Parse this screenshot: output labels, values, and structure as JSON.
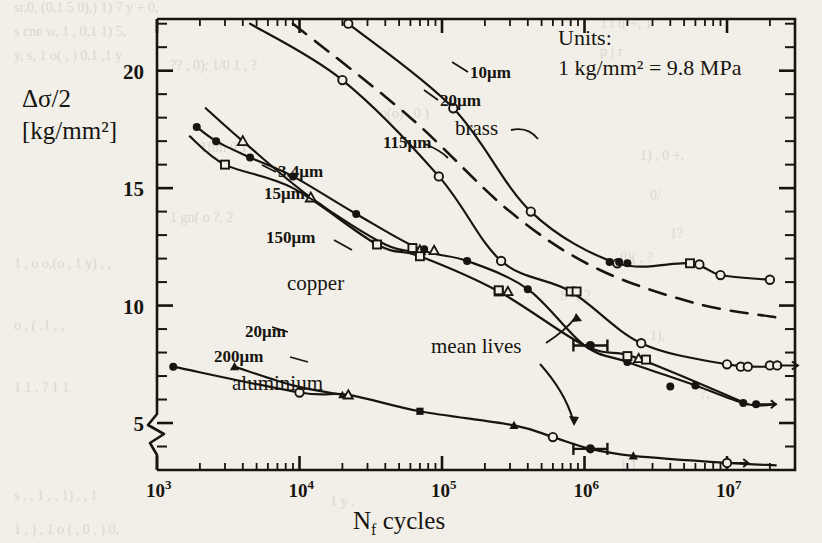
{
  "figure": {
    "axis_label_y_line1": "Δσ/2",
    "axis_label_y_line2": "[kg/mm²]",
    "axis_label_x": "N",
    "axis_label_x_sub": "f",
    "axis_label_x_rest": "cycles",
    "units_line1": "Units:",
    "units_line2": "1 kg/mm² = 9.8 MPa",
    "annotation_mean_lives": "mean lives",
    "material_brass": "brass",
    "material_copper": "copper",
    "material_aluminium": "aluminium",
    "label_brass_10": "10μm",
    "label_brass_20": "20μm",
    "label_brass_115": "115μm",
    "label_copper_34": "3.4μm",
    "label_copper_15": "15μm",
    "label_copper_150": "150μm",
    "label_alu_20": "20μm",
    "label_alu_200": "200μm",
    "ytick_5": "5",
    "ytick_10": "10",
    "ytick_15": "15",
    "ytick_20": "20",
    "xtick_3": "10",
    "xtick_3_sup": "3",
    "xtick_4": "10",
    "xtick_4_sup": "4",
    "xtick_5": "10",
    "xtick_5_sup": "5",
    "xtick_6": "10",
    "xtick_6_sup": "6",
    "xtick_7": "10",
    "xtick_7_sup": "7",
    "ink_color": "#17150f",
    "paper_color": "#f2efe9"
  },
  "chart_data": {
    "type": "line",
    "title": "",
    "xlabel": "N_f cycles",
    "ylabel": "Δσ/2 [kg/mm²]",
    "xscale": "log",
    "yscale": "linear",
    "xlim": [
      1000,
      30000000
    ],
    "ylim": [
      3,
      22.2
    ],
    "yticks": [
      5,
      10,
      15,
      20
    ],
    "yminor_step": 1,
    "xticks": [
      1000,
      10000,
      100000,
      1000000,
      10000000
    ],
    "grid": false,
    "legend": "inline-labels",
    "axis_break": "y-axis lower break",
    "units_note": "1 kg/mm2 = 9.8 MPa",
    "series": [
      {
        "name": "brass 10μm",
        "material": "brass",
        "grain_size": "10μm",
        "style": "solid",
        "marker": "open-circle",
        "x": [
          22000,
          120000,
          420000,
          1700000,
          5500000,
          9000000,
          20000000
        ],
        "y": [
          22.0,
          18.4,
          14.0,
          11.8,
          11.8,
          11.3,
          11.1
        ]
      },
      {
        "name": "brass 20μm",
        "material": "brass",
        "grain_size": "20μm",
        "style": "dashed",
        "marker": "none",
        "x": [
          9000,
          60000,
          300000,
          1200000,
          6000000,
          22000000
        ],
        "y": [
          22.0,
          18.0,
          14.0,
          11.6,
          10.1,
          9.5
        ]
      },
      {
        "name": "brass 115μm",
        "material": "brass",
        "grain_size": "115μm",
        "style": "solid",
        "marker": "open-circle",
        "x": [
          4500,
          20000,
          95000,
          260000,
          800000,
          2500000,
          10000000,
          22000000
        ],
        "y": [
          22.0,
          19.6,
          15.5,
          11.9,
          10.6,
          8.4,
          7.5,
          7.4
        ]
      },
      {
        "name": "copper 3.4μm",
        "material": "copper",
        "grain_size": "3.4μm",
        "style": "solid",
        "marker": "open-triangle",
        "x": [
          2200,
          4000,
          12000,
          40000,
          70000
        ],
        "y": [
          18.4,
          17.0,
          14.6,
          12.6,
          12.3
        ]
      },
      {
        "name": "copper 15μm",
        "material": "copper",
        "grain_size": "15μm",
        "style": "solid",
        "marker": "filled-circle",
        "x": [
          1900,
          2600,
          4500,
          9000,
          25000,
          70000,
          150000,
          400000,
          1000000,
          2000000,
          6000000,
          14000000,
          22000000
        ],
        "y": [
          17.6,
          17.0,
          16.3,
          15.5,
          13.9,
          12.4,
          11.9,
          10.7,
          8.3,
          7.6,
          6.6,
          5.8,
          5.8
        ]
      },
      {
        "name": "copper 150μm",
        "material": "copper",
        "grain_size": "150μm",
        "style": "solid",
        "marker": "open-square",
        "x": [
          1700,
          3000,
          9000,
          35000,
          70000,
          250000,
          1000000,
          2000000,
          4000000,
          14000000
        ],
        "y": [
          17.2,
          16.0,
          15.0,
          12.6,
          12.1,
          10.6,
          8.3,
          7.9,
          7.2,
          5.8
        ]
      },
      {
        "name": "aluminium 20μm",
        "material": "aluminium",
        "grain_size": "20μm",
        "style": "solid",
        "marker": "filled-triangle",
        "x": [
          3500,
          9000,
          20000
        ],
        "y": [
          7.4,
          6.6,
          6.2
        ]
      },
      {
        "name": "aluminium 200μm",
        "material": "aluminium",
        "grain_size": "200μm",
        "style": "solid",
        "marker": "mixed",
        "x": [
          1300,
          10000,
          22000,
          70000,
          320000,
          600000,
          1100000,
          2200000,
          10000000,
          22000000
        ],
        "y": [
          7.4,
          6.3,
          6.2,
          5.5,
          4.9,
          4.4,
          3.9,
          3.6,
          3.3,
          3.2
        ]
      }
    ],
    "mean_life_markers": [
      {
        "x": 1100000,
        "y": 8.3,
        "series": "copper 15μm"
      },
      {
        "x": 1100000,
        "y": 3.9,
        "series": "aluminium 200μm"
      }
    ]
  }
}
